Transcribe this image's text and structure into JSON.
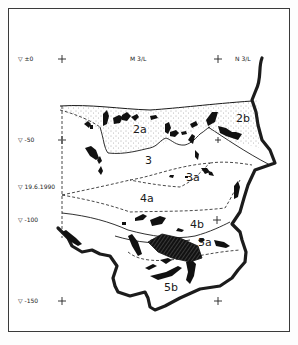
{
  "figure": {
    "type": "stratigraphic section drawing",
    "colors": {
      "ink": "#1a1a1a",
      "paper": "#ffffff",
      "frame": "#3a3a3a"
    }
  },
  "grid": {
    "columns": [
      {
        "label": "M 3/L",
        "x": 130
      },
      {
        "label": "N 3/L",
        "x": 243
      }
    ],
    "depth_markers": [
      {
        "symbol": "▽",
        "label": "±0",
        "y": 59
      },
      {
        "symbol": "▽",
        "label": "-50",
        "y": 140
      },
      {
        "symbol": "▽",
        "label": "19.6.1990",
        "y": 187
      },
      {
        "symbol": "▽",
        "label": "-100",
        "y": 220
      },
      {
        "symbol": "▽",
        "label": "-150",
        "y": 301
      }
    ]
  },
  "layers": [
    {
      "id": "2a",
      "label": "2a"
    },
    {
      "id": "2b",
      "label": "2b"
    },
    {
      "id": "3",
      "label": "3"
    },
    {
      "id": "3a",
      "label": "3a"
    },
    {
      "id": "4a",
      "label": "4a"
    },
    {
      "id": "4b",
      "label": "4b"
    },
    {
      "id": "5a",
      "label": "5a"
    },
    {
      "id": "5b",
      "label": "5b"
    }
  ]
}
